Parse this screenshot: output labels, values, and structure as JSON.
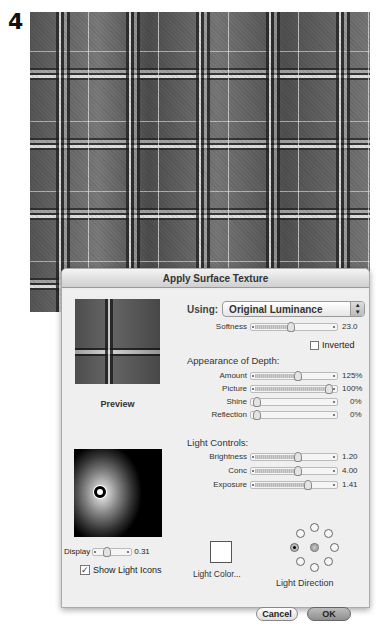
{
  "step_number": "4",
  "dialog": {
    "title": "Apply Surface Texture",
    "preview_label": "Preview",
    "using": {
      "label": "Using:",
      "selected": "Original Luminance"
    },
    "softness": {
      "label": "Softness",
      "value": "23.0",
      "position": 0.5
    },
    "inverted": {
      "label": "Inverted",
      "checked": false
    },
    "appearance_of_depth": {
      "heading": "Appearance of Depth:",
      "sliders": [
        {
          "label": "Amount",
          "value": "125%",
          "position": 0.55
        },
        {
          "label": "Picture",
          "value": "100%",
          "position": 0.98
        },
        {
          "label": "Shine",
          "value": "0%",
          "position": 0.0
        },
        {
          "label": "Reflection",
          "value": "0%",
          "position": 0.0
        }
      ]
    },
    "light_controls": {
      "heading": "Light Controls:",
      "sliders": [
        {
          "label": "Brightness",
          "value": "1.20",
          "position": 0.55
        },
        {
          "label": "Conc",
          "value": "4.00",
          "position": 0.55
        },
        {
          "label": "Exposure",
          "value": "1.41",
          "position": 0.68
        }
      ]
    },
    "display": {
      "label": "Display",
      "value": "0.31",
      "position": 0.3
    },
    "show_light_icons": {
      "label": "Show Light Icons",
      "checked": true
    },
    "light_color_label": "Light Color...",
    "light_direction": {
      "label": "Light Direction",
      "selected": "left"
    },
    "buttons": {
      "cancel": "Cancel",
      "ok": "OK"
    }
  },
  "caption_fragment": "Adding highlights and shadows to the"
}
